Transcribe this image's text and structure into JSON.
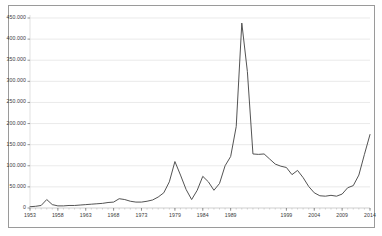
{
  "chart_data": {
    "type": "line",
    "title": "",
    "subtitle": "",
    "xlabel": "",
    "ylabel": "",
    "xlim": [
      1953,
      2014
    ],
    "ylim": [
      0,
      450000
    ],
    "grid": true,
    "grid_axis": "y",
    "legend": false,
    "legend_position": "none",
    "line_color": "#4a4a4a",
    "frame_color": "#9a9a9a",
    "gridline_color": "#dcdcdc",
    "background_color": "#ffffff",
    "ytick_labels": [
      "450.000",
      "400.000",
      "350.000",
      "300.000",
      "250.000",
      "200.000",
      "150.000",
      "100.000",
      "50.000",
      "0"
    ],
    "ytick_values": [
      450000,
      400000,
      350000,
      300000,
      250000,
      200000,
      150000,
      100000,
      50000,
      0
    ],
    "xtick_labels": [
      "1953",
      "1958",
      "1963",
      "1968",
      "1973",
      "1979",
      "1984",
      "1989",
      "1999",
      "2004",
      "2009",
      "2014"
    ],
    "xtick_values": [
      1953,
      1958,
      1963,
      1968,
      1973,
      1979,
      1984,
      1989,
      1999,
      2004,
      2009,
      2014
    ],
    "series": [
      {
        "name": "value",
        "x": [
          1953,
          1954,
          1955,
          1956,
          1957,
          1958,
          1959,
          1960,
          1961,
          1962,
          1963,
          1964,
          1965,
          1966,
          1967,
          1968,
          1969,
          1970,
          1971,
          1972,
          1973,
          1974,
          1975,
          1976,
          1977,
          1978,
          1979,
          1980,
          1981,
          1982,
          1983,
          1984,
          1985,
          1986,
          1987,
          1988,
          1989,
          1990,
          1991,
          1992,
          1993,
          1994,
          1995,
          1996,
          1997,
          1998,
          1999,
          2000,
          2001,
          2002,
          2003,
          2004,
          2005,
          2006,
          2007,
          2008,
          2009,
          2010,
          2011,
          2012,
          2013,
          2014
        ],
        "values": [
          3000,
          4000,
          6000,
          20000,
          8000,
          5000,
          5000,
          6000,
          6000,
          7000,
          8000,
          9000,
          10000,
          11000,
          13000,
          14000,
          22000,
          20000,
          16000,
          14000,
          14000,
          16000,
          19000,
          26000,
          36000,
          62000,
          110000,
          78000,
          44000,
          20000,
          42000,
          75000,
          62000,
          42000,
          58000,
          100000,
          122000,
          193000,
          438000,
          323000,
          128000,
          127000,
          128000,
          116000,
          104000,
          99000,
          96000,
          79000,
          89000,
          72000,
          51000,
          36000,
          29000,
          28000,
          30000,
          28000,
          33000,
          48000,
          53000,
          78000,
          127000,
          174000
        ]
      }
    ]
  },
  "axis_geometry": {
    "plot_left": 30,
    "plot_right": 370,
    "plot_top": 18,
    "plot_bottom": 208
  }
}
